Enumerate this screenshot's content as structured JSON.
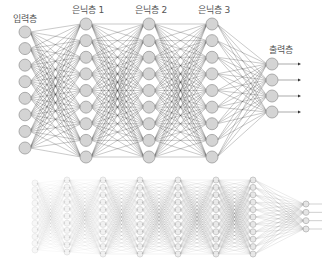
{
  "top_network": {
    "layers": [
      {
        "name": "input",
        "label": "입력층",
        "x": 25,
        "count": 8,
        "y_start": 32,
        "y_end": 148,
        "label_x": 25,
        "label_y": 12
      },
      {
        "name": "hidden1",
        "label": "은닉층 1",
        "x": 86,
        "count": 9,
        "y_start": 24,
        "y_end": 157,
        "label_x": 88,
        "label_y": 3
      },
      {
        "name": "hidden2",
        "label": "은닉층 2",
        "x": 149,
        "count": 9,
        "y_start": 24,
        "y_end": 157,
        "label_x": 151,
        "label_y": 3
      },
      {
        "name": "hidden3",
        "label": "은닉층 3",
        "x": 212,
        "count": 9,
        "y_start": 24,
        "y_end": 157,
        "label_x": 214,
        "label_y": 3
      },
      {
        "name": "output",
        "label": "출력층",
        "x": 272,
        "count": 4,
        "y_start": 64,
        "y_end": 112,
        "label_x": 281,
        "label_y": 43
      }
    ],
    "node_radius": 6,
    "node_fill": "#d4d4d4",
    "node_stroke": "#9a9a9a",
    "edge_color": "#333333",
    "arrow_end_x": 301
  },
  "bottom_network": {
    "layers": [
      {
        "x": 35,
        "count": 11,
        "y_start": 183,
        "y_end": 250
      },
      {
        "x": 67,
        "count": 11,
        "y_start": 180,
        "y_end": 252
      },
      {
        "x": 103,
        "count": 11,
        "y_start": 180,
        "y_end": 254
      },
      {
        "x": 140,
        "count": 11,
        "y_start": 180,
        "y_end": 254
      },
      {
        "x": 178,
        "count": 11,
        "y_start": 180,
        "y_end": 254
      },
      {
        "x": 216,
        "count": 11,
        "y_start": 180,
        "y_end": 254
      },
      {
        "x": 253,
        "count": 11,
        "y_start": 180,
        "y_end": 254
      },
      {
        "x": 306,
        "count": 4,
        "y_start": 204,
        "y_end": 229
      }
    ],
    "node_radius": 3,
    "arrow_end_x": 322
  }
}
